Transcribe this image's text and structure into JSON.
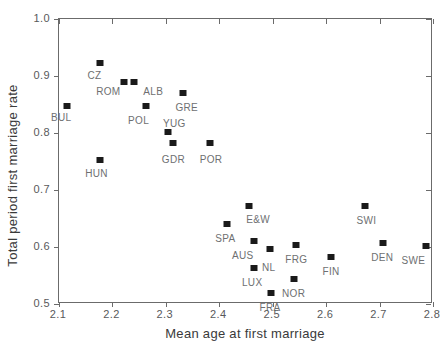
{
  "chart_data": {
    "type": "scatter",
    "title": "",
    "xlabel": "Mean age at first marriage",
    "ylabel": "Total period first marriage rate",
    "xlim": [
      2.1,
      2.8
    ],
    "ylim": [
      0.5,
      1.0
    ],
    "xticks": [
      "2.1",
      "2.2",
      "2.3",
      "2.4",
      "2.5",
      "2.6",
      "2.7",
      "2.8"
    ],
    "yticks": [
      "0.5",
      "0.6",
      "0.7",
      "0.8",
      "0.9",
      "1.0"
    ],
    "grid": false,
    "legend": "none",
    "marker_color": "#1a1a1a",
    "points": [
      {
        "label": "BUL",
        "x": 2.115,
        "y": 0.848,
        "lx": -16,
        "ly": 6
      },
      {
        "label": "CZ",
        "x": 2.176,
        "y": 0.922,
        "lx": -12,
        "ly": 7
      },
      {
        "label": "HUN",
        "x": 2.177,
        "y": 0.752,
        "lx": -15,
        "ly": 8
      },
      {
        "label": "ROM",
        "x": 2.222,
        "y": 0.889,
        "lx": -28,
        "ly": 4
      },
      {
        "label": "ALB",
        "x": 2.241,
        "y": 0.889,
        "lx": 9,
        "ly": 4
      },
      {
        "label": "POL",
        "x": 2.263,
        "y": 0.847,
        "lx": -18,
        "ly": 9
      },
      {
        "label": "YUG",
        "x": 2.304,
        "y": 0.801,
        "lx": -5,
        "ly": -14
      },
      {
        "label": "GDR",
        "x": 2.313,
        "y": 0.783,
        "lx": -11,
        "ly": 11
      },
      {
        "label": "GRE",
        "x": 2.333,
        "y": 0.871,
        "lx": -8,
        "ly": 9
      },
      {
        "label": "POR",
        "x": 2.382,
        "y": 0.783,
        "lx": -10,
        "ly": 11
      },
      {
        "label": "SPA",
        "x": 2.415,
        "y": 0.64,
        "lx": -12,
        "ly": 9
      },
      {
        "label": "E&W",
        "x": 2.456,
        "y": 0.672,
        "lx": -3,
        "ly": 8
      },
      {
        "label": "AUS",
        "x": 2.465,
        "y": 0.61,
        "lx": -22,
        "ly": 9
      },
      {
        "label": "NL",
        "x": 2.495,
        "y": 0.597,
        "lx": -8,
        "ly": 13
      },
      {
        "label": "LUX",
        "x": 2.465,
        "y": 0.564,
        "lx": -12,
        "ly": 9
      },
      {
        "label": "FRA",
        "x": 2.496,
        "y": 0.52,
        "lx": -11,
        "ly": 9
      },
      {
        "label": "FRG",
        "x": 2.544,
        "y": 0.603,
        "lx": -11,
        "ly": 9
      },
      {
        "label": "NOR",
        "x": 2.54,
        "y": 0.543,
        "lx": -12,
        "ly": 9
      },
      {
        "label": "FIN",
        "x": 2.61,
        "y": 0.582,
        "lx": -9,
        "ly": 9
      },
      {
        "label": "SWI",
        "x": 2.672,
        "y": 0.672,
        "lx": -8,
        "ly": 9
      },
      {
        "label": "DEN",
        "x": 2.707,
        "y": 0.607,
        "lx": -12,
        "ly": 9
      },
      {
        "label": "SWE",
        "x": 2.786,
        "y": 0.601,
        "lx": -24,
        "ly": 9
      }
    ]
  }
}
